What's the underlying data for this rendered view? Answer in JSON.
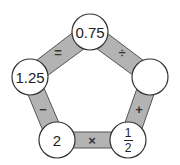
{
  "diagram": {
    "type": "pentagon-operation-puzzle",
    "colors": {
      "band": "#b3b3b3",
      "band_stroke": "#555555",
      "node_fill": "#ffffff",
      "node_stroke": "#333333"
    },
    "nodes": [
      {
        "id": "top",
        "value": "0.75"
      },
      {
        "id": "right",
        "value": ""
      },
      {
        "id": "bottom-right",
        "value": "1/2",
        "numerator": "1",
        "denominator": "2"
      },
      {
        "id": "bottom-left",
        "value": "2"
      },
      {
        "id": "left",
        "value": "1.25"
      }
    ],
    "edges": [
      {
        "from": "top",
        "to": "right",
        "operator": "÷"
      },
      {
        "from": "right",
        "to": "bottom-right",
        "operator": "+"
      },
      {
        "from": "bottom-right",
        "to": "bottom-left",
        "operator": "×"
      },
      {
        "from": "bottom-left",
        "to": "left",
        "operator": "−"
      },
      {
        "from": "left",
        "to": "top",
        "operator": "="
      }
    ]
  }
}
